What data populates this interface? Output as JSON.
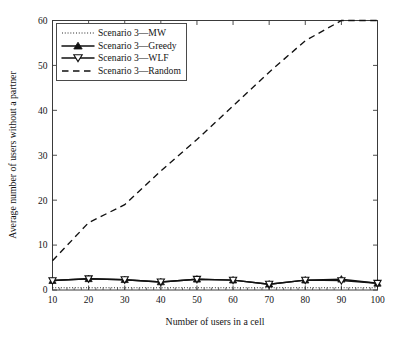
{
  "figure": {
    "background_color": "#ffffff",
    "line_color": "#111111",
    "axis_color": "#3a3a3a"
  },
  "chart_data": {
    "type": "line",
    "title": "",
    "subtitle": "",
    "xlabel": "Number of users in a cell",
    "ylabel": "Average number of users without a partner",
    "x": [
      10,
      20,
      30,
      40,
      50,
      60,
      70,
      80,
      90,
      100
    ],
    "xlim": [
      10,
      100
    ],
    "ylim": [
      0,
      60
    ],
    "xticks": [
      10,
      20,
      30,
      40,
      50,
      60,
      70,
      80,
      90,
      100
    ],
    "yticks": [
      0,
      10,
      20,
      30,
      40,
      50,
      60
    ],
    "xtick_labels": [
      "10",
      "20",
      "30",
      "40",
      "50",
      "60",
      "70",
      "80",
      "90",
      "100"
    ],
    "ytick_labels": [
      "0",
      "10",
      "20",
      "30",
      "40",
      "50",
      "60"
    ],
    "grid": false,
    "minor_ticks_x": true,
    "legend_position": "upper-left-inside",
    "series": [
      {
        "name": "Scenario 3—MW",
        "line_style": "dotted",
        "marker": "none",
        "values": [
          0.5,
          0.5,
          0.5,
          0.5,
          0.5,
          0.5,
          0.5,
          0.5,
          0.5,
          0.5
        ]
      },
      {
        "name": "Scenario 3—Greedy",
        "line_style": "solid",
        "marker": "triangle-up-filled",
        "values": [
          2.1,
          2.5,
          2.3,
          1.8,
          2.4,
          2.2,
          1.3,
          2.2,
          2.4,
          1.5
        ]
      },
      {
        "name": "Scenario 3—WLF",
        "line_style": "solid",
        "marker": "triangle-down-open",
        "values": [
          2.1,
          2.5,
          2.3,
          1.8,
          2.4,
          2.2,
          1.3,
          2.2,
          2.1,
          1.5
        ]
      },
      {
        "name": "Scenario 3—Random",
        "line_style": "dashed",
        "marker": "none",
        "values": [
          6.5,
          15.0,
          19.0,
          26.5,
          33.5,
          41.0,
          48.5,
          55.5,
          60.0,
          60.0
        ]
      }
    ]
  },
  "legend": {
    "entries": [
      {
        "label": "Scenario 3—MW",
        "style": "dotted",
        "marker": "none"
      },
      {
        "label": "Scenario 3—Greedy",
        "style": "solid",
        "marker": "triangle-up-filled"
      },
      {
        "label": "Scenario 3—WLF",
        "style": "solid",
        "marker": "triangle-down-open"
      },
      {
        "label": "Scenario 3—Random",
        "style": "dashed",
        "marker": "none"
      }
    ]
  }
}
